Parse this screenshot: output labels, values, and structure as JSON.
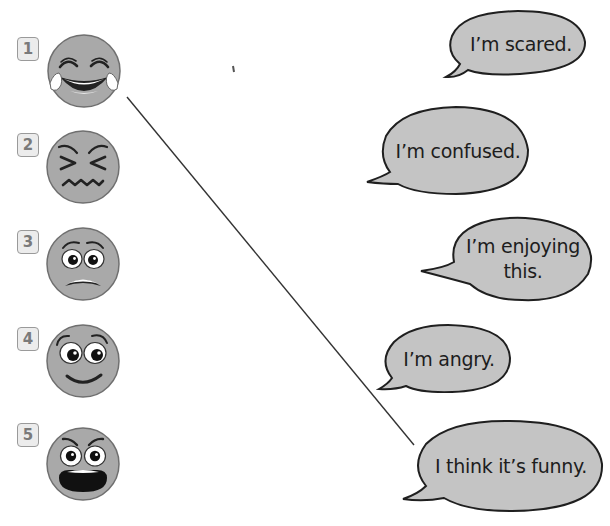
{
  "worksheet": {
    "colors": {
      "face_fill": "#a9a9a9",
      "face_stroke": "#6f6f6f",
      "bubble_fill": "#c4c4c4",
      "bubble_stroke": "#1f1f1f",
      "feature": "#222222",
      "number_box_fill": "#ececec",
      "number_box_border": "#9a9a9a",
      "connector_line": "#333333"
    },
    "faces": [
      {
        "number": "1",
        "expression": "laughing-with-tears"
      },
      {
        "number": "2",
        "expression": "squinting-confused"
      },
      {
        "number": "3",
        "expression": "worried-scared"
      },
      {
        "number": "4",
        "expression": "happy-smiling"
      },
      {
        "number": "5",
        "expression": "angry-shouting"
      }
    ],
    "bubbles": [
      {
        "text": "I’m scared."
      },
      {
        "text": "I’m confused."
      },
      {
        "text_line1": "I’m enjoying",
        "text_line2": "this."
      },
      {
        "text": "I’m angry."
      },
      {
        "text": "I think it’s funny."
      }
    ],
    "connector": {
      "from_face": "1",
      "to_bubble": "I think it’s funny.",
      "x1": 127,
      "y1": 97,
      "x2": 414,
      "y2": 445
    }
  }
}
